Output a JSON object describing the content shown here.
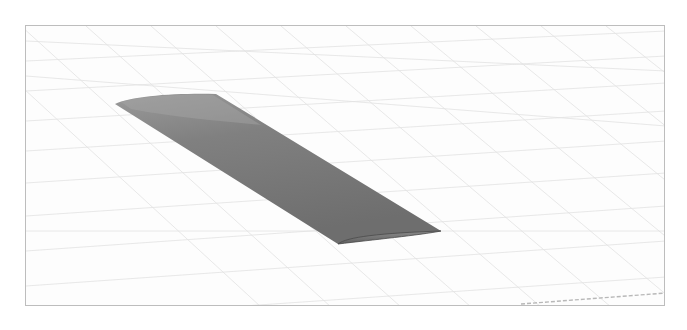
{
  "scene": {
    "title": "",
    "object": "wing",
    "description": "3D rendered straight wing with airfoil cross-section on a perspective ground grid",
    "colors": {
      "background": "#ffffff",
      "frame": "#bdbdbd",
      "grid": "#e4e4e4",
      "wing_light": "#9a9a9a",
      "wing_mid": "#7c7c7c",
      "wing_dark": "#666666",
      "tip_edge": "#4a4a4a"
    }
  }
}
